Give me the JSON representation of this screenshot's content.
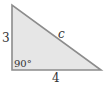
{
  "diagram": {
    "type": "right-triangle",
    "fill_color": "#e6e6e6",
    "stroke_color": "#8c8c8c",
    "vertices": {
      "top": [
        12,
        5
      ],
      "right_angle": [
        12,
        70
      ],
      "bottom_right": [
        101,
        70
      ]
    },
    "labels": {
      "vertical_leg": "3",
      "horizontal_leg": "4",
      "hypotenuse": "c",
      "right_angle": "90°"
    }
  }
}
